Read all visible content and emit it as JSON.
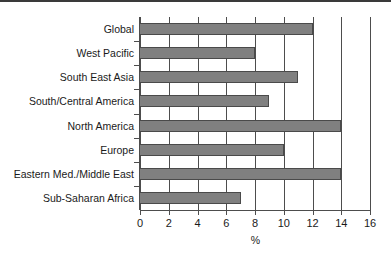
{
  "chart_data": {
    "type": "bar",
    "orientation": "horizontal",
    "title": "",
    "xlabel": "%",
    "ylabel": "",
    "categories": [
      "Global",
      "West Pacific",
      "South East Asia",
      "South/Central America",
      "North America",
      "Europe",
      "Eastern Med./Middle East",
      "Sub-Saharan Africa"
    ],
    "values": [
      12,
      8,
      11,
      9,
      14,
      10,
      14,
      7
    ],
    "xlim": [
      0,
      16
    ],
    "xticks": [
      0,
      2,
      4,
      6,
      8,
      10,
      12,
      14,
      16
    ],
    "xtick_labels": [
      "0",
      "2",
      "4",
      "6",
      "8",
      "10",
      "12",
      "14",
      "16"
    ],
    "grid": "vertical",
    "legend": "none",
    "bar_color": "#808080",
    "axis_color": "#4d4d4d",
    "background": "#ffffff"
  }
}
